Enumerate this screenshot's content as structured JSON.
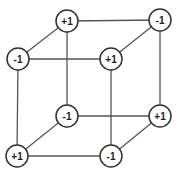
{
  "diagram": {
    "type": "cube-vertex-labels",
    "nodes": [
      {
        "id": "top-back-left",
        "label": "+1",
        "x": 67,
        "y": 21
      },
      {
        "id": "top-back-right",
        "label": "-1",
        "x": 160,
        "y": 20
      },
      {
        "id": "top-front-left",
        "label": "-1",
        "x": 18,
        "y": 59
      },
      {
        "id": "top-front-right",
        "label": "+1",
        "x": 111,
        "y": 59
      },
      {
        "id": "bottom-back-left",
        "label": "-1",
        "x": 67,
        "y": 116
      },
      {
        "id": "bottom-back-right",
        "label": "+1",
        "x": 160,
        "y": 116
      },
      {
        "id": "bottom-front-left",
        "label": "+1",
        "x": 17,
        "y": 156
      },
      {
        "id": "bottom-front-right",
        "label": "-1",
        "x": 111,
        "y": 156
      }
    ],
    "edges": [
      [
        "top-back-left",
        "top-back-right"
      ],
      [
        "top-front-left",
        "top-front-right"
      ],
      [
        "top-back-left",
        "top-front-left"
      ],
      [
        "top-back-right",
        "top-front-right"
      ],
      [
        "bottom-back-left",
        "bottom-back-right"
      ],
      [
        "bottom-front-left",
        "bottom-front-right"
      ],
      [
        "bottom-back-left",
        "bottom-front-left"
      ],
      [
        "bottom-back-right",
        "bottom-front-right"
      ],
      [
        "top-back-left",
        "bottom-back-left"
      ],
      [
        "top-back-right",
        "bottom-back-right"
      ],
      [
        "top-front-left",
        "bottom-front-left"
      ],
      [
        "top-front-right",
        "bottom-front-right"
      ]
    ],
    "node_radius": 11,
    "colors": {
      "stroke": "#333333",
      "edge": "#555555",
      "fill": "#ffffff",
      "text": "#222222"
    }
  }
}
